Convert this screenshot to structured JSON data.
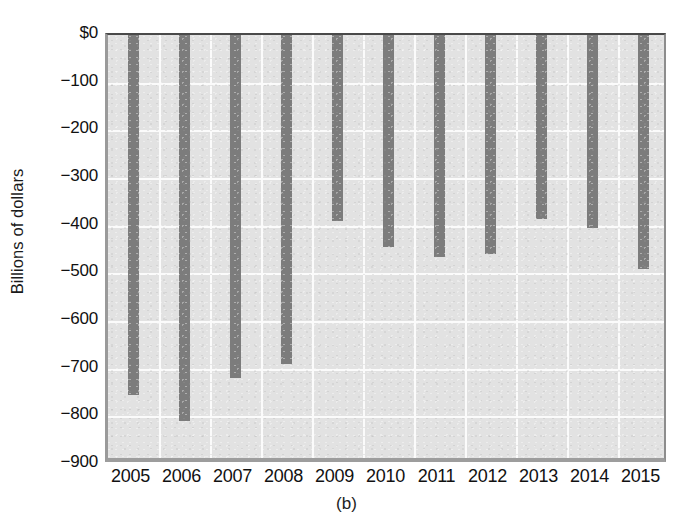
{
  "chart_data": {
    "type": "bar",
    "title": "",
    "subtitle": "",
    "xlabel": "",
    "ylabel": "Billions of dollars",
    "categories": [
      "2005",
      "2006",
      "2007",
      "2008",
      "2009",
      "2010",
      "2011",
      "2012",
      "2013",
      "2014",
      "2015"
    ],
    "values": [
      -755,
      -810,
      -720,
      -690,
      -390,
      -445,
      -465,
      -460,
      -385,
      -405,
      -490
    ],
    "ylim": [
      -900,
      0
    ],
    "y_ticks": [
      0,
      -100,
      -200,
      -300,
      -400,
      -500,
      -600,
      -700,
      -800,
      -900
    ],
    "y_tick_labels": [
      "$0",
      "−100",
      "−200",
      "−300",
      "−400",
      "−500",
      "−600",
      "−700",
      "−800",
      "−900"
    ],
    "grid": true,
    "grid_color": "#fbfbfb",
    "legend": "none",
    "bar_color": "#7c7c7c",
    "plot_background": "#e2e2e2",
    "orientation": "vertical-downward",
    "bar_anchor": "zero-top",
    "annotations": []
  },
  "caption": {
    "panel_label": "(b)"
  }
}
